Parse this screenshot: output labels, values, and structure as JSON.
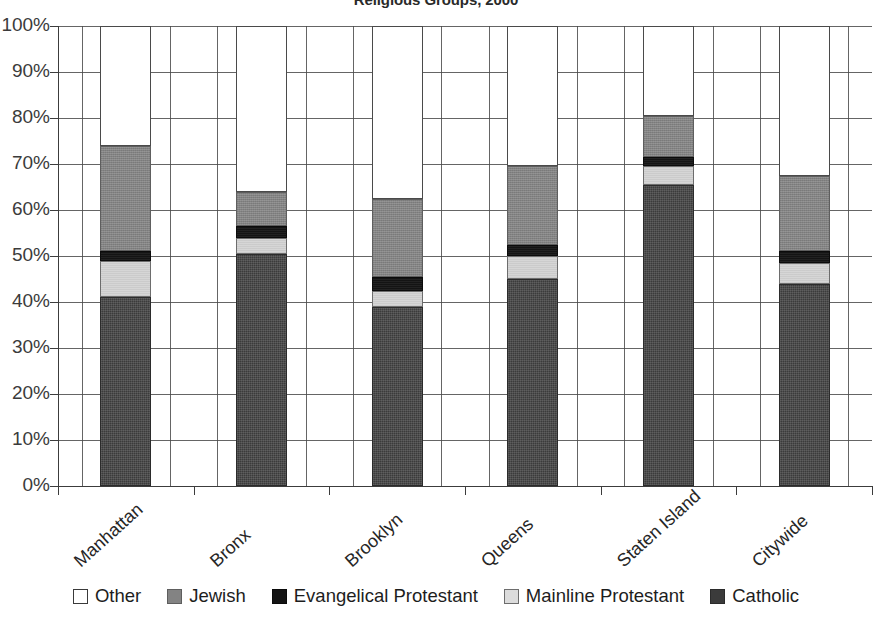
{
  "chart_data": {
    "type": "bar",
    "stacked": true,
    "stack_mode": "percent",
    "title": "Religious Groups, 2000",
    "xlabel": "",
    "ylabel": "",
    "ylim": [
      0,
      100
    ],
    "ytick_labels": [
      "100%",
      "90%",
      "80%",
      "70%",
      "60%",
      "50%",
      "40%",
      "30%",
      "20%",
      "10%",
      "0%"
    ],
    "ytick_values": [
      100,
      90,
      80,
      70,
      60,
      50,
      40,
      30,
      20,
      10,
      0
    ],
    "grid": true,
    "grid_axis": "both",
    "legend_position": "bottom",
    "categories": [
      "Manhattan",
      "Bronx",
      "Brooklyn",
      "Queens",
      "Staten Island",
      "Citywide"
    ],
    "series": [
      {
        "name": "Catholic",
        "color": "#3b3b3b",
        "values": [
          41.0,
          50.5,
          39.0,
          45.0,
          65.5,
          44.0
        ]
      },
      {
        "name": "Mainline Protestant",
        "color": "#d6d6d6",
        "values": [
          8.0,
          3.5,
          3.5,
          5.0,
          4.0,
          4.5
        ]
      },
      {
        "name": "Evangelical Protestant",
        "color": "#141414",
        "values": [
          2.0,
          2.5,
          3.0,
          2.5,
          2.0,
          2.5
        ]
      },
      {
        "name": "Jewish",
        "color": "#838383",
        "values": [
          23.0,
          7.5,
          17.0,
          17.0,
          9.0,
          16.5
        ]
      },
      {
        "name": "Other",
        "color": "#ffffff",
        "values": [
          26.0,
          36.0,
          37.5,
          30.5,
          19.5,
          32.5
        ]
      }
    ],
    "cumulative_tops": {
      "Manhattan": [
        41.0,
        49.0,
        51.0,
        74.0,
        100.0
      ],
      "Bronx": [
        50.5,
        54.0,
        56.5,
        64.0,
        100.0
      ],
      "Brooklyn": [
        39.0,
        42.5,
        45.5,
        62.5,
        100.0
      ],
      "Queens": [
        45.0,
        50.0,
        52.5,
        69.5,
        100.0
      ],
      "Staten Island": [
        65.5,
        69.5,
        71.5,
        80.5,
        100.0
      ],
      "Citywide": [
        44.0,
        48.5,
        51.0,
        67.5,
        100.0
      ]
    }
  },
  "legend": {
    "items": [
      {
        "label": "Other",
        "swatch": "sw-other"
      },
      {
        "label": "Jewish",
        "swatch": "sw-jewish"
      },
      {
        "label": "Evangelical Protestant",
        "swatch": "sw-evangelical"
      },
      {
        "label": "Mainline Protestant",
        "swatch": "sw-mainline"
      },
      {
        "label": "Catholic",
        "swatch": "sw-catholic"
      }
    ]
  }
}
